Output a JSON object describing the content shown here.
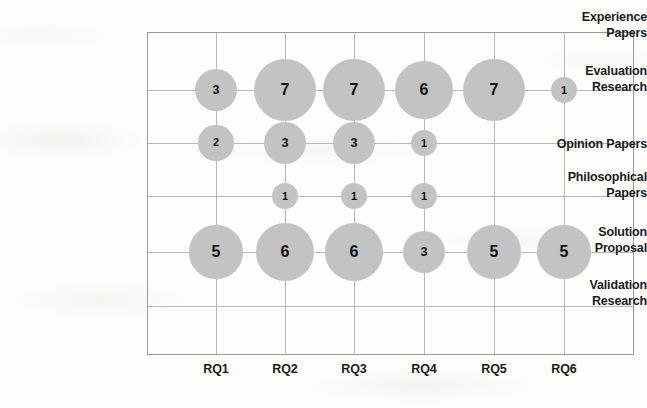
{
  "chart_data": {
    "type": "scatter",
    "subtype": "bubble",
    "title": "",
    "xlabel": "",
    "ylabel": "",
    "grid": true,
    "legend": false,
    "categories": [
      "RQ1",
      "RQ2",
      "RQ3",
      "RQ4",
      "RQ5",
      "RQ6"
    ],
    "y_categories": [
      "Experience Papers",
      "Evaluation Research",
      "Opinion Papers",
      "Philosophical Papers",
      "Solution Proposal",
      "Validation Research"
    ],
    "series": [
      {
        "name": "Evaluation Research",
        "values": [
          3,
          7,
          7,
          6,
          7,
          1
        ]
      },
      {
        "name": "Opinion Papers",
        "values": [
          2,
          3,
          3,
          1,
          null,
          null
        ]
      },
      {
        "name": "Philosophical Papers",
        "values": [
          null,
          1,
          1,
          1,
          null,
          null
        ]
      },
      {
        "name": "Solution Proposal",
        "values": [
          5,
          6,
          6,
          3,
          5,
          5
        ]
      },
      {
        "name": "Experience Papers",
        "values": [
          null,
          null,
          null,
          null,
          null,
          null
        ]
      },
      {
        "name": "Validation Research",
        "values": [
          null,
          null,
          null,
          null,
          null,
          null
        ]
      }
    ],
    "points": [
      {
        "x": "RQ1",
        "y": "Evaluation Research",
        "value": 3
      },
      {
        "x": "RQ2",
        "y": "Evaluation Research",
        "value": 7
      },
      {
        "x": "RQ3",
        "y": "Evaluation Research",
        "value": 7
      },
      {
        "x": "RQ4",
        "y": "Evaluation Research",
        "value": 6
      },
      {
        "x": "RQ5",
        "y": "Evaluation Research",
        "value": 7
      },
      {
        "x": "RQ6",
        "y": "Evaluation Research",
        "value": 1
      },
      {
        "x": "RQ1",
        "y": "Opinion Papers",
        "value": 2
      },
      {
        "x": "RQ2",
        "y": "Opinion Papers",
        "value": 3
      },
      {
        "x": "RQ3",
        "y": "Opinion Papers",
        "value": 3
      },
      {
        "x": "RQ4",
        "y": "Opinion Papers",
        "value": 1
      },
      {
        "x": "RQ2",
        "y": "Philosophical Papers",
        "value": 1
      },
      {
        "x": "RQ3",
        "y": "Philosophical Papers",
        "value": 1
      },
      {
        "x": "RQ4",
        "y": "Philosophical Papers",
        "value": 1
      },
      {
        "x": "RQ1",
        "y": "Solution Proposal",
        "value": 5
      },
      {
        "x": "RQ2",
        "y": "Solution Proposal",
        "value": 6
      },
      {
        "x": "RQ3",
        "y": "Solution Proposal",
        "value": 6
      },
      {
        "x": "RQ4",
        "y": "Solution Proposal",
        "value": 3
      },
      {
        "x": "RQ5",
        "y": "Solution Proposal",
        "value": 5
      },
      {
        "x": "RQ6",
        "y": "Solution Proposal",
        "value": 5
      }
    ],
    "colors": {
      "bubble_fill": "#c3c3c3",
      "bubble_label": "#111111",
      "gridline": "#b8b8b8",
      "axis_border": "#9a9a9a",
      "axis_label": "#1a1a1a",
      "background": "#fdfdfb"
    }
  },
  "axis": {
    "y_labels": [
      {
        "text_line1": "Experience",
        "text_line2": "Papers"
      },
      {
        "text_line1": "Evaluation",
        "text_line2": "Research"
      },
      {
        "text_line1": "Opinion Papers",
        "text_line2": ""
      },
      {
        "text_line1": "Philosophical",
        "text_line2": "Papers"
      },
      {
        "text_line1": "Solution",
        "text_line2": "Proposal"
      },
      {
        "text_line1": "Validation",
        "text_line2": "Research"
      }
    ],
    "x_labels": [
      "RQ1",
      "RQ2",
      "RQ3",
      "RQ4",
      "RQ5",
      "RQ6"
    ]
  },
  "layout": {
    "x_positions": [
      216,
      285,
      354,
      424,
      494,
      564
    ],
    "row_positions": [
      36,
      90,
      143,
      196,
      252,
      306
    ],
    "plot": {
      "left": 147,
      "top": 32,
      "width": 487,
      "height": 323
    }
  }
}
